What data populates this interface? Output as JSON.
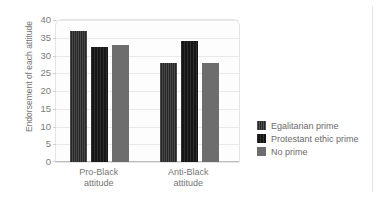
{
  "figure": {
    "name": "grouped-bar-chart",
    "page_top_sliver_text": "",
    "colors": {
      "series_egalitarian": "#272727",
      "series_protestant": "#161616",
      "series_noprime": "#6d6d6d",
      "gridline": "#e9e9ec",
      "axis": "#bdbdbd",
      "text": "#757575",
      "plot_background": "#fdfdfd",
      "plot_border": "#e4e4e6"
    }
  },
  "chart_data": {
    "type": "bar",
    "title": "",
    "xlabel": "",
    "ylabel": "Endorsement of each attitude",
    "ylim": [
      0,
      40
    ],
    "yticks": [
      0,
      5,
      10,
      15,
      20,
      25,
      30,
      35,
      40
    ],
    "ytick_labels": [
      "0",
      "5",
      "10",
      "15",
      "20",
      "25",
      "30",
      "35",
      "40"
    ],
    "grid": true,
    "legend_position": "right",
    "categories": [
      "Pro-Black attitude",
      "Anti-Black attitude"
    ],
    "category_lines": [
      [
        "Pro-Black",
        "attitude"
      ],
      [
        "Anti-Black",
        "attitude"
      ]
    ],
    "series": [
      {
        "name": "Egalitarian prime",
        "values": [
          37,
          28
        ]
      },
      {
        "name": "Protestant ethic prime",
        "values": [
          32.5,
          34
        ]
      },
      {
        "name": "No prime",
        "values": [
          33,
          28
        ]
      }
    ]
  },
  "legend": {
    "items": [
      {
        "label": "Egalitarian prime"
      },
      {
        "label": "Protestant ethic prime"
      },
      {
        "label": "No prime"
      }
    ]
  }
}
